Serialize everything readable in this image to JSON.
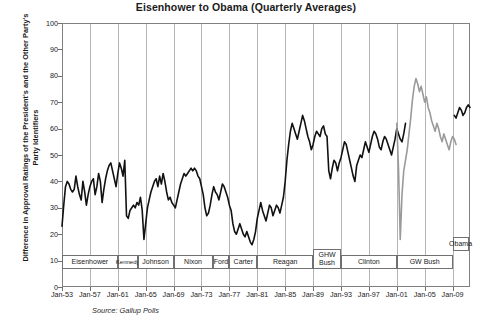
{
  "chart_data": {
    "type": "line",
    "title": "Eisenhower to Obama  (Quarterly Averages)",
    "xlabel": "",
    "ylabel": "Difference in Approval Ratings of the President's and the Other Party's Party Identifiers",
    "source": "Source:  Gallup Polls",
    "ylim": [
      0,
      100
    ],
    "yticks": [
      0,
      10,
      20,
      30,
      40,
      50,
      60,
      70,
      80,
      90,
      100
    ],
    "xlim": [
      "Jan-53",
      "Jan-11"
    ],
    "xticks": [
      "Jan-53",
      "Jan-57",
      "Jan-61",
      "Jan-65",
      "Jan-69",
      "Jan-73",
      "Jan-77",
      "Jan-81",
      "Jan-85",
      "Jan-89",
      "Jan-93",
      "Jan-97",
      "Jan-01",
      "Jan-05",
      "Jan-09"
    ],
    "grid": "vertical-only",
    "legend_position": "none",
    "series": [
      {
        "name": "Partisan approval gap (black segment, 1953-2001)",
        "color": "#111111",
        "x_start": 1953.0,
        "x_step_years": 0.25,
        "values": [
          23,
          31,
          38,
          40,
          39,
          37,
          36,
          37,
          42,
          38,
          35,
          33,
          40,
          36,
          31,
          35,
          38,
          40,
          41,
          35,
          38,
          43,
          40,
          32,
          37,
          41,
          44,
          46,
          47,
          44,
          41,
          38,
          43,
          47,
          45,
          42,
          48,
          27,
          26,
          29,
          30,
          31,
          30,
          32,
          31,
          34,
          29,
          18,
          24,
          30,
          33,
          36,
          38,
          40,
          41,
          38,
          42,
          39,
          43,
          40,
          36,
          33,
          34,
          32,
          31,
          30,
          33,
          36,
          39,
          41,
          43,
          42,
          43,
          44,
          45,
          44,
          45,
          44,
          42,
          41,
          38,
          35,
          30,
          27,
          28,
          31,
          35,
          38,
          36,
          35,
          33,
          36,
          39,
          38,
          36,
          34,
          31,
          29,
          24,
          21,
          20,
          22,
          24,
          22,
          20,
          19,
          21,
          19,
          17,
          16,
          18,
          21,
          26,
          29,
          32,
          29,
          27,
          25,
          28,
          31,
          30,
          27,
          29,
          31,
          30,
          28,
          31,
          34,
          40,
          48,
          54,
          59,
          62,
          60,
          58,
          56,
          59,
          62,
          65,
          63,
          60,
          57,
          55,
          52,
          54,
          57,
          59,
          58,
          57,
          60,
          61,
          58,
          57,
          44,
          41,
          45,
          48,
          47,
          44,
          47,
          49,
          52,
          55,
          54,
          51,
          48,
          45,
          42,
          40,
          46,
          48,
          50,
          49,
          52,
          55,
          53,
          51,
          54,
          57,
          59,
          58,
          56,
          53,
          52,
          55,
          57,
          56,
          54,
          52,
          50,
          53,
          56,
          60,
          58,
          56,
          55,
          58,
          62
        ],
        "note": "Black line from Eisenhower through Clinton"
      },
      {
        "name": "Partisan approval gap (gray segment, 2001-2009, GW Bush)",
        "color": "#9a9a9a",
        "x_start": 2001.0,
        "x_step_years": 0.25,
        "values": [
          62,
          45,
          18,
          35,
          44,
          48,
          52,
          58,
          64,
          71,
          76,
          79,
          77,
          74,
          76,
          73,
          70,
          72,
          68,
          66,
          63,
          61,
          59,
          62,
          60,
          57,
          55,
          58,
          56,
          54,
          52,
          55,
          57,
          56,
          54
        ],
        "note": "Gray line spanning the GW Bush presidency, dip after 9/11 then peak near 79"
      },
      {
        "name": "Partisan approval gap (black segment, Obama)",
        "color": "#111111",
        "x_start": 2009.25,
        "x_step_years": 0.25,
        "values": [
          65,
          64,
          66,
          68,
          67,
          65,
          66,
          68,
          69,
          68
        ],
        "note": "Final short black segment under the Obama label"
      }
    ],
    "president_bands": [
      {
        "label": "Eisenhower",
        "start": "Jan-53",
        "end": "Jan-61",
        "row": "low"
      },
      {
        "label": "Kennedy",
        "start": "Jan-61",
        "end": "Nov-63",
        "row": "low"
      },
      {
        "label": "Johnson",
        "start": "Nov-63",
        "end": "Jan-69",
        "row": "low"
      },
      {
        "label": "Nixon",
        "start": "Jan-69",
        "end": "Aug-74",
        "row": "low"
      },
      {
        "label": "Ford",
        "start": "Aug-74",
        "end": "Jan-77",
        "row": "low"
      },
      {
        "label": "Carter",
        "start": "Jan-77",
        "end": "Jan-81",
        "row": "low"
      },
      {
        "label": "Reagan",
        "start": "Jan-81",
        "end": "Jan-89",
        "row": "low"
      },
      {
        "label": "GHW Bush",
        "start": "Jan-89",
        "end": "Jan-93",
        "row": "raised"
      },
      {
        "label": "Clinton",
        "start": "Jan-93",
        "end": "Jan-01",
        "row": "low"
      },
      {
        "label": "GW Bush",
        "start": "Jan-01",
        "end": "Jan-09",
        "row": "low"
      },
      {
        "label": "Obama",
        "start": "Jan-09",
        "end": "Jan-11",
        "row": "top"
      }
    ]
  }
}
